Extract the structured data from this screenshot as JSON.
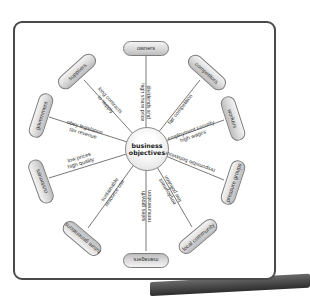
{
  "diagram": {
    "center": {
      "line1": "business",
      "line2": "objectives"
    },
    "stakeholders": [
      {
        "name": "owners",
        "objective": [
          "dividends and",
          "high share price"
        ]
      },
      {
        "name": "competitors",
        "objective": [
          "fair competition"
        ]
      },
      {
        "name": "workers",
        "objective": [
          "employment security",
          "high wages"
        ]
      },
      {
        "name": "pressure groups",
        "objective": [
          "responsible behaviour"
        ]
      },
      {
        "name": "local community",
        "objective": [
          "employment",
          "low pollution"
        ]
      },
      {
        "name": "managers",
        "objective": [
          "sales growth",
          "remuneration"
        ]
      },
      {
        "name": "future generations",
        "objective": [
          "sustainable",
          "resource use"
        ]
      },
      {
        "name": "customers",
        "objective": [
          "low prices",
          "high quality"
        ]
      },
      {
        "name": "government",
        "objective": [
          "obey legislation",
          "tax revenue"
        ]
      },
      {
        "name": "suppliers",
        "objective": [
          "long contracts",
          "to supply"
        ]
      }
    ]
  }
}
